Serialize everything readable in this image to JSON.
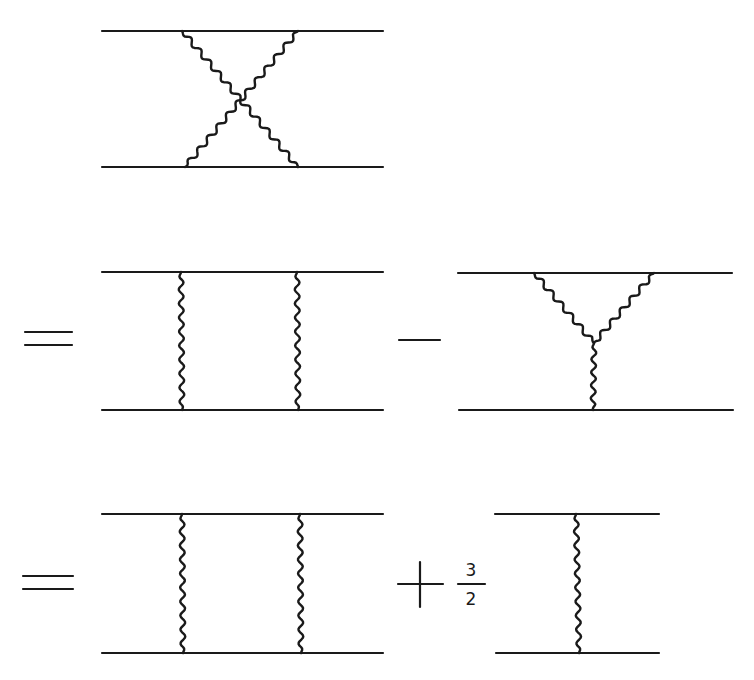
{
  "figure": {
    "rows": [
      {
        "id": "crossed-box",
        "operator": "",
        "diagrams": [
          {
            "type": "crossed-box",
            "fermion_lines_y": [
              31,
              167
            ],
            "x_range": [
              102,
              383
            ],
            "bosons": [
              {
                "from": [
                  182,
                  31
                ],
                "to": [
                  298,
                  167
                ]
              },
              {
                "from": [
                  298,
                  31
                ],
                "to": [
                  185,
                  167
                ]
              }
            ]
          }
        ]
      },
      {
        "id": "row-2",
        "operator": "=",
        "diagrams": [
          {
            "type": "box",
            "fermion_lines_y": [
              272,
              410
            ],
            "x_range": [
              102,
              383
            ],
            "bosons_x": [
              181,
              297
            ]
          },
          {
            "operator": "−",
            "type": "triple-vertex",
            "fermion_lines_y": [
              273,
              410
            ],
            "x_range": [
              458,
              732
            ],
            "vertex": [
              594,
              343
            ],
            "top_legs_x": [
              534,
              654
            ],
            "bottom_leg_x": 593
          }
        ]
      },
      {
        "id": "row-3",
        "operator": "=",
        "diagrams": [
          {
            "type": "box",
            "fermion_lines_y": [
              514,
              653
            ],
            "x_range": [
              102,
              383
            ],
            "bosons_x": [
              182,
              300
            ]
          },
          {
            "operator": "+",
            "coefficient": {
              "numerator": "3",
              "denominator": "2"
            },
            "type": "single-exchange",
            "fermion_lines_y": [
              514,
              653
            ],
            "x_range": [
              495,
              659
            ],
            "boson_x": 577
          }
        ]
      }
    ],
    "labels": {
      "equals_1": "=",
      "minus": "−",
      "equals_2": "=",
      "plus": "+",
      "fraction_numerator": "3",
      "fraction_denominator": "2"
    },
    "colors": {
      "ink": "#1a1a1a",
      "background": "#ffffff"
    }
  }
}
